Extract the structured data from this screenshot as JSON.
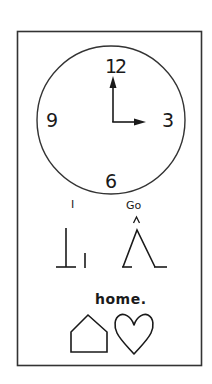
{
  "card": {
    "description": "Picture-symbol sentence card",
    "frame_color": "#333333",
    "background": "#ffffff",
    "ink_color": "#1a1a1a"
  },
  "clock": {
    "numerals": {
      "twelve": "12",
      "three": "3",
      "six": "6",
      "nine": "9"
    },
    "time_shown": "3:00",
    "hour_hand_points_to": "3",
    "minute_hand_points_to": "12"
  },
  "sentence": {
    "words": [
      {
        "label": "I",
        "symbol": "i-symbol"
      },
      {
        "label": "Go",
        "symbol": "go-symbol"
      },
      {
        "label": "home.",
        "symbol": "home-symbol"
      }
    ]
  }
}
